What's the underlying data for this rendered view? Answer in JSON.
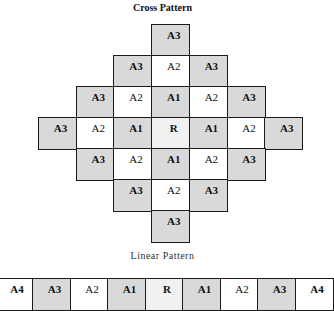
{
  "cross_pattern": {
    "title": "Cross Pattern",
    "origin": {
      "x": 38,
      "y": 24
    },
    "cell_w": 37.7,
    "cell_h": 31,
    "cells": [
      {
        "row": 0,
        "col": 3,
        "label": "A3",
        "shade": "shade"
      },
      {
        "row": 1,
        "col": 2,
        "label": "A3",
        "shade": "shade"
      },
      {
        "row": 1,
        "col": 3,
        "label": "A2",
        "shade": "white"
      },
      {
        "row": 1,
        "col": 4,
        "label": "A3",
        "shade": "shade"
      },
      {
        "row": 2,
        "col": 1,
        "label": "A3",
        "shade": "shade"
      },
      {
        "row": 2,
        "col": 2,
        "label": "A2",
        "shade": "white"
      },
      {
        "row": 2,
        "col": 3,
        "label": "A1",
        "shade": "shade"
      },
      {
        "row": 2,
        "col": 4,
        "label": "A2",
        "shade": "white"
      },
      {
        "row": 2,
        "col": 5,
        "label": "A3",
        "shade": "shade"
      },
      {
        "row": 3,
        "col": 0,
        "label": "A3",
        "shade": "shade"
      },
      {
        "row": 3,
        "col": 1,
        "label": "A2",
        "shade": "white"
      },
      {
        "row": 3,
        "col": 2,
        "label": "A1",
        "shade": "shade"
      },
      {
        "row": 3,
        "col": 3,
        "label": "R",
        "shade": "ref"
      },
      {
        "row": 3,
        "col": 4,
        "label": "A1",
        "shade": "shade"
      },
      {
        "row": 3,
        "col": 5,
        "label": "A2",
        "shade": "white"
      },
      {
        "row": 3,
        "col": 6,
        "label": "A3",
        "shade": "shade"
      },
      {
        "row": 4,
        "col": 1,
        "label": "A3",
        "shade": "shade"
      },
      {
        "row": 4,
        "col": 2,
        "label": "A2",
        "shade": "white"
      },
      {
        "row": 4,
        "col": 3,
        "label": "A1",
        "shade": "shade"
      },
      {
        "row": 4,
        "col": 4,
        "label": "A2",
        "shade": "white"
      },
      {
        "row": 4,
        "col": 5,
        "label": "A3",
        "shade": "shade"
      },
      {
        "row": 5,
        "col": 2,
        "label": "A3",
        "shade": "shade"
      },
      {
        "row": 5,
        "col": 3,
        "label": "A2",
        "shade": "white"
      },
      {
        "row": 5,
        "col": 4,
        "label": "A3",
        "shade": "shade"
      },
      {
        "row": 6,
        "col": 3,
        "label": "A3",
        "shade": "shade"
      }
    ]
  },
  "linear_pattern": {
    "title": "Linear Pattern",
    "origin": {
      "x": -5.5,
      "y": 278
    },
    "cell_w": 37.5,
    "cell_h": 31,
    "cells": [
      {
        "label": "A4",
        "shade": "white"
      },
      {
        "label": "A3",
        "shade": "shade"
      },
      {
        "label": "A2",
        "shade": "white"
      },
      {
        "label": "A1",
        "shade": "shade"
      },
      {
        "label": "R",
        "shade": "ref"
      },
      {
        "label": "A1",
        "shade": "shade"
      },
      {
        "label": "A2",
        "shade": "white"
      },
      {
        "label": "A3",
        "shade": "shade"
      },
      {
        "label": "A4",
        "shade": "white"
      }
    ]
  },
  "colors": {
    "shade": "#d9d9d9",
    "ref": "#f1f1f1",
    "white": "#ffffff",
    "border": "#1a1a1a"
  }
}
